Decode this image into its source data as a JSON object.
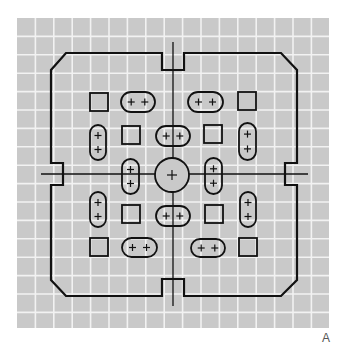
{
  "figure": {
    "panel_label": "A",
    "colors": {
      "background": "#ffffff",
      "grid_fill": "#c9c9c9",
      "grid_line": "#f2f2f2",
      "stroke": "#111111",
      "label": "#555555"
    },
    "grid": {
      "x0": 17,
      "y0": 18,
      "x1": 329,
      "y1": 328,
      "cell": 18.4
    },
    "outline": {
      "description": "Chamfered square board outline with notches at the midpoint of each side",
      "points": [
        [
          66,
          53
        ],
        [
          162,
          53
        ],
        [
          162,
          70
        ],
        [
          184,
          70
        ],
        [
          184,
          53
        ],
        [
          281,
          53
        ],
        [
          297,
          70
        ],
        [
          297,
          163
        ],
        [
          285,
          163
        ],
        [
          285,
          185
        ],
        [
          297,
          185
        ],
        [
          297,
          280
        ],
        [
          281,
          296
        ],
        [
          184,
          296
        ],
        [
          184,
          279
        ],
        [
          162,
          279
        ],
        [
          162,
          296
        ],
        [
          66,
          296
        ],
        [
          51,
          280
        ],
        [
          51,
          185
        ],
        [
          63,
          185
        ],
        [
          63,
          163
        ],
        [
          51,
          163
        ],
        [
          51,
          70
        ]
      ]
    },
    "center_lines": {
      "vertical": {
        "x": 173,
        "y1": 42,
        "y2": 306
      },
      "horizontal": {
        "y": 174,
        "x1": 41,
        "x2": 308
      }
    },
    "center_circle": {
      "cx": 172,
      "cy": 175,
      "r": 17,
      "symbol": "+"
    },
    "squares": [
      {
        "x": 90,
        "y": 93,
        "size": 18
      },
      {
        "x": 238,
        "y": 92,
        "size": 18
      },
      {
        "x": 122,
        "y": 126,
        "size": 18
      },
      {
        "x": 204,
        "y": 125,
        "size": 18
      },
      {
        "x": 122,
        "y": 205,
        "size": 18
      },
      {
        "x": 205,
        "y": 205,
        "size": 18
      },
      {
        "x": 90,
        "y": 238,
        "size": 18
      },
      {
        "x": 239,
        "y": 238,
        "size": 18
      }
    ],
    "pills": [
      {
        "orientation": "horizontal",
        "x": 121,
        "y": 92,
        "w": 34,
        "h": 20,
        "symbols": [
          "+",
          "+"
        ]
      },
      {
        "orientation": "horizontal",
        "x": 188,
        "y": 92,
        "w": 35,
        "h": 20,
        "symbols": [
          "+",
          "+"
        ]
      },
      {
        "orientation": "vertical",
        "x": 90,
        "y": 125,
        "w": 16,
        "h": 35,
        "symbols": [
          "+",
          "+"
        ]
      },
      {
        "orientation": "horizontal",
        "x": 156,
        "y": 126,
        "w": 34,
        "h": 20,
        "symbols": [
          "+",
          "+"
        ]
      },
      {
        "orientation": "vertical",
        "x": 239,
        "y": 123,
        "w": 17,
        "h": 37,
        "symbols": [
          "+",
          "+"
        ]
      },
      {
        "orientation": "vertical",
        "x": 122,
        "y": 159,
        "w": 17,
        "h": 35,
        "symbols": [
          "+",
          "+"
        ]
      },
      {
        "orientation": "vertical",
        "x": 205,
        "y": 158,
        "w": 17,
        "h": 36,
        "symbols": [
          "+",
          "+"
        ]
      },
      {
        "orientation": "vertical",
        "x": 90,
        "y": 192,
        "w": 16,
        "h": 35,
        "symbols": [
          "+",
          "+"
        ]
      },
      {
        "orientation": "horizontal",
        "x": 156,
        "y": 206,
        "w": 34,
        "h": 20,
        "symbols": [
          "+",
          "+"
        ]
      },
      {
        "orientation": "vertical",
        "x": 240,
        "y": 192,
        "w": 16,
        "h": 35,
        "symbols": [
          "+",
          "+"
        ]
      },
      {
        "orientation": "horizontal",
        "x": 122,
        "y": 238,
        "w": 35,
        "h": 19,
        "symbols": [
          "+",
          "+"
        ]
      },
      {
        "orientation": "horizontal",
        "x": 191,
        "y": 239,
        "w": 34,
        "h": 18,
        "symbols": [
          "+",
          "+"
        ]
      }
    ]
  }
}
